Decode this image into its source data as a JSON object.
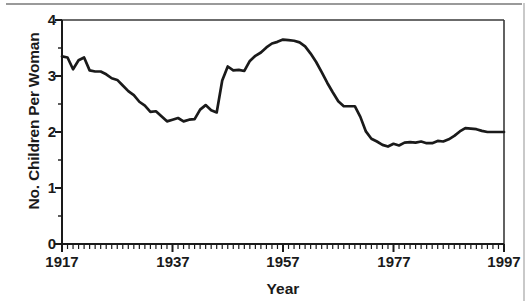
{
  "chart_data": {
    "type": "line",
    "title": "",
    "xlabel": "Year",
    "ylabel": "No. Children Per Woman",
    "xlim": [
      1917,
      1997
    ],
    "ylim": [
      0,
      4
    ],
    "grid": false,
    "legend": "none",
    "x_major_ticks": [
      1917,
      1937,
      1957,
      1977,
      1997
    ],
    "x_minor_tick_step": 1,
    "y_major_ticks": [
      0,
      1,
      2,
      3,
      4
    ],
    "y_minor_tick_step": 0.5,
    "series": [
      {
        "name": "Total Fertility Rate",
        "color": "#1a1a1a",
        "x": [
          1917,
          1918,
          1919,
          1920,
          1921,
          1922,
          1923,
          1924,
          1925,
          1926,
          1927,
          1928,
          1929,
          1930,
          1931,
          1932,
          1933,
          1934,
          1935,
          1936,
          1937,
          1938,
          1939,
          1940,
          1941,
          1942,
          1943,
          1944,
          1945,
          1946,
          1947,
          1948,
          1949,
          1950,
          1951,
          1952,
          1953,
          1954,
          1955,
          1956,
          1957,
          1958,
          1959,
          1960,
          1961,
          1962,
          1963,
          1964,
          1965,
          1966,
          1967,
          1968,
          1969,
          1970,
          1971,
          1972,
          1973,
          1974,
          1975,
          1976,
          1977,
          1978,
          1979,
          1980,
          1981,
          1982,
          1983,
          1984,
          1985,
          1986,
          1987,
          1988,
          1989,
          1990,
          1991,
          1992,
          1993,
          1994,
          1995,
          1996,
          1997
        ],
        "y": [
          3.35,
          3.33,
          3.12,
          3.28,
          3.33,
          3.1,
          3.08,
          3.08,
          3.03,
          2.96,
          2.93,
          2.83,
          2.73,
          2.66,
          2.54,
          2.47,
          2.36,
          2.37,
          2.28,
          2.19,
          2.22,
          2.25,
          2.19,
          2.22,
          2.23,
          2.4,
          2.48,
          2.39,
          2.35,
          2.92,
          3.17,
          3.1,
          3.11,
          3.09,
          3.27,
          3.36,
          3.42,
          3.51,
          3.58,
          3.61,
          3.65,
          3.64,
          3.63,
          3.6,
          3.53,
          3.4,
          3.25,
          3.07,
          2.88,
          2.71,
          2.55,
          2.46,
          2.46,
          2.46,
          2.27,
          2.01,
          1.88,
          1.83,
          1.77,
          1.74,
          1.79,
          1.76,
          1.81,
          1.82,
          1.81,
          1.83,
          1.8,
          1.8,
          1.84,
          1.83,
          1.87,
          1.93,
          2.01,
          2.07,
          2.06,
          2.05,
          2.02,
          2.0,
          2.0,
          2.0,
          2.0
        ]
      }
    ]
  },
  "axis": {
    "y_labels": [
      "4",
      "3",
      "2",
      "1",
      "0"
    ],
    "x_labels": [
      "1917",
      "1937",
      "1957",
      "1977",
      "1997"
    ],
    "x_title": "Year",
    "y_title": "No. Children Per Woman"
  }
}
